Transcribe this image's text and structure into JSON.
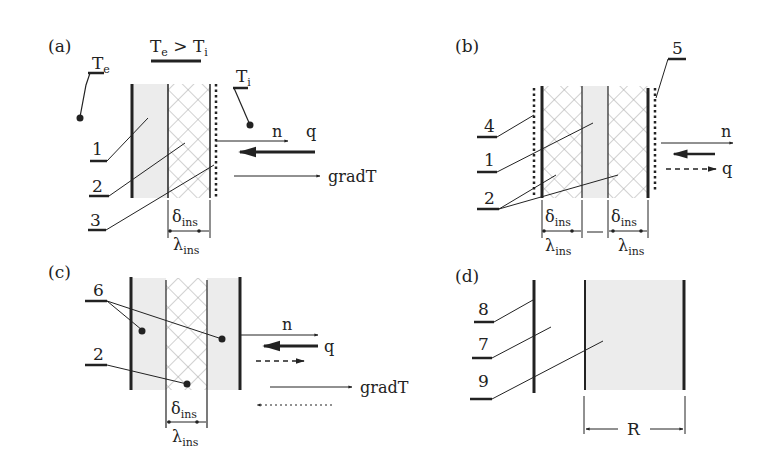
{
  "figure": {
    "panels": [
      {
        "id": "a",
        "label": "(a)",
        "condition": "T",
        "condition_sub_e": "e",
        "condition_rel": " > T",
        "condition_sub_i": "i",
        "Te": "T",
        "Te_sub": "e",
        "Ti": "T",
        "Ti_sub": "i",
        "callouts": [
          "1",
          "2",
          "3"
        ],
        "vectors": [
          "n",
          "q",
          "gradT"
        ],
        "delta": "δ",
        "lambda": "λ",
        "sub": "ins"
      },
      {
        "id": "b",
        "label": "(b)",
        "callouts": [
          "4",
          "1",
          "2",
          "5"
        ],
        "vectors": [
          "n",
          "q"
        ],
        "delta": "δ",
        "lambda": "λ",
        "sub": "ins"
      },
      {
        "id": "c",
        "label": "(c)",
        "callouts": [
          "6",
          "2"
        ],
        "vectors": [
          "n",
          "q",
          "gradT"
        ],
        "delta": "δ",
        "lambda": "λ",
        "sub": "ins"
      },
      {
        "id": "d",
        "label": "(d)",
        "callouts": [
          "8",
          "7",
          "9"
        ],
        "dimension": "R"
      }
    ],
    "colors": {
      "line": "#222222",
      "fill": "#ececec",
      "hatch": "#9a9a9a"
    }
  }
}
